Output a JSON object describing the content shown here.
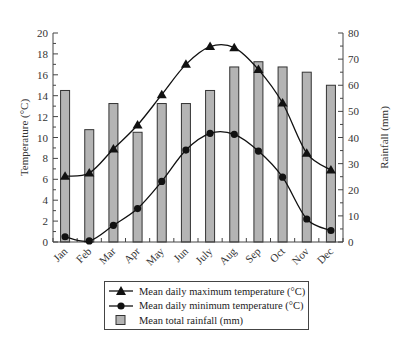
{
  "chart_data": {
    "type": "bar+line",
    "title": "",
    "categories": [
      "Jan",
      "Feb",
      "Mar",
      "Apr",
      "May",
      "Jun",
      "July",
      "Aug",
      "Sep",
      "Oct",
      "Nov",
      "Dec"
    ],
    "series": [
      {
        "name": "Mean daily maximum temperature (°C)",
        "type": "line",
        "marker": "triangle",
        "axis": "left",
        "values": [
          6.3,
          6.6,
          8.9,
          11.2,
          14.1,
          17.0,
          18.7,
          18.6,
          16.5,
          13.3,
          8.5,
          6.9
        ]
      },
      {
        "name": "Mean daily minimum temperature (°C)",
        "type": "line",
        "marker": "circle",
        "axis": "left",
        "values": [
          0.5,
          0.1,
          1.6,
          3.2,
          5.8,
          8.8,
          10.4,
          10.3,
          8.7,
          6.2,
          2.2,
          1.1
        ]
      },
      {
        "name": "Mean total rainfall (mm)",
        "type": "bar",
        "axis": "right",
        "values": [
          58,
          43,
          53,
          42,
          53,
          53,
          58,
          67,
          69,
          67,
          65,
          60
        ]
      }
    ],
    "ylabel": "Temperature (°C)",
    "ylabel_right": "Rainfall (mm)",
    "xlabel": "",
    "ylim": [
      0,
      20
    ],
    "ylim_right": [
      0,
      80
    ],
    "yticks": [
      0,
      2,
      4,
      6,
      8,
      10,
      12,
      14,
      16,
      18,
      20
    ],
    "yticks_right": [
      0,
      10,
      20,
      30,
      40,
      50,
      60,
      70,
      80
    ],
    "grid": false,
    "legend_position": "bottom"
  },
  "legend": {
    "max_label": "Mean daily maximum temperature (°C)",
    "min_label": "Mean daily minimum temperature (°C)",
    "rain_label": "Mean total rainfall (mm)"
  },
  "colors": {
    "bar_fill": "#b4b4b4",
    "bar_stroke": "#333333",
    "line": "#111111"
  }
}
